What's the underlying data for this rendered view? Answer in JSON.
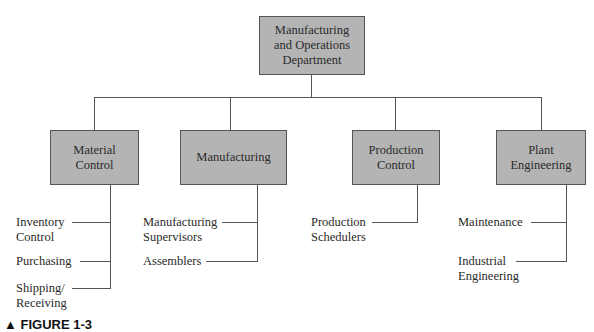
{
  "root": {
    "label": "Manufacturing\nand Operations\nDepartment"
  },
  "departments": [
    {
      "label": "Material\nControl",
      "children": [
        "Inventory\nControl",
        "Purchasing",
        "Shipping/\nReceiving"
      ]
    },
    {
      "label": "Manufacturing",
      "children": [
        "Manufacturing\nSupervisors",
        "Assemblers"
      ]
    },
    {
      "label": "Production\nControl",
      "children": [
        "Production\nSchedulers"
      ]
    },
    {
      "label": "Plant\nEngineering",
      "children": [
        "Maintenance",
        "Industrial\nEngineering"
      ]
    }
  ],
  "caption": "▲ FIGURE 1-3"
}
